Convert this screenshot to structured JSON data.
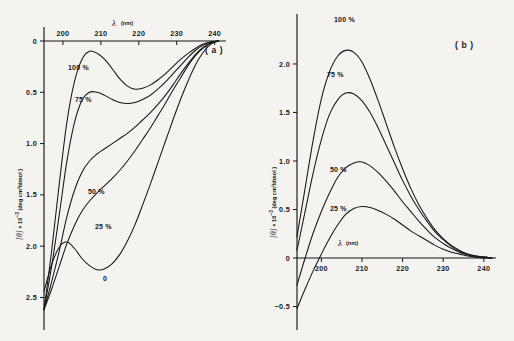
{
  "figure": {
    "background_color": "#f4f3f0",
    "ink_color": "#161616",
    "panel_a_tag": "( a )",
    "panel_b_tag": "( b )"
  },
  "panel_a": {
    "name": "panel-a",
    "x_axis": {
      "title_symbol": "λ",
      "title_unit": "(nm)",
      "ticks": [
        200,
        210,
        220,
        230,
        240
      ],
      "tick_labels": [
        "200",
        "210",
        "220",
        "230",
        "240"
      ],
      "range": [
        195,
        243
      ],
      "position": "top"
    },
    "y_axis": {
      "title_symbol": "[θ]",
      "title_mid": " × 10",
      "title_exp": "−3",
      "title_unit": " (deg cm²/dmol )",
      "ticks": [
        0,
        0.5,
        1.0,
        1.5,
        2.0,
        2.5
      ],
      "tick_labels": [
        "0",
        "0.5",
        "1.0",
        "1.5",
        "2.0",
        "2.5"
      ],
      "range": [
        0,
        2.7
      ],
      "direction": "inverted-downward"
    },
    "curve_labels": [
      "100 %",
      "75 %",
      "50 %",
      "25 %",
      "0"
    ]
  },
  "panel_b": {
    "name": "panel-b",
    "x_axis": {
      "title_symbol": "λ",
      "title_unit": "(nm)",
      "ticks": [
        200,
        210,
        220,
        230,
        240
      ],
      "tick_labels": [
        "200",
        "210",
        "220",
        "230",
        "240"
      ],
      "range": [
        194,
        243
      ],
      "position": "bottom"
    },
    "y_axis": {
      "title_symbol": "[θ]",
      "title_mid": " × 10",
      "title_exp": "−3",
      "title_unit": " (deg cm²/dmol )",
      "ticks": [
        -0.5,
        0,
        0.5,
        1.0,
        1.5,
        2.0
      ],
      "tick_labels": [
        "−0.5",
        "0",
        "0.5",
        "1.0",
        "1.5",
        "2.0"
      ],
      "range": [
        -0.65,
        2.35
      ]
    },
    "curve_labels": [
      "100 %",
      "75 %",
      "50 %",
      "25 %"
    ]
  },
  "chart_data": [
    {
      "type": "line",
      "title": "Panel (a) CD spectra",
      "xlabel": "λ (nm)",
      "ylabel": "[θ] × 10⁻³ (deg cm²/dmol)",
      "xlim": [
        195,
        243
      ],
      "ylim": [
        0,
        2.7
      ],
      "y_inverted": true,
      "grid": false,
      "legend": "inline-annotations",
      "x": [
        195,
        197,
        199,
        201,
        203,
        205,
        207,
        209,
        211,
        213,
        215,
        217,
        219,
        221,
        223,
        225,
        227,
        229,
        231,
        233,
        235,
        237,
        239,
        241
      ],
      "series": [
        {
          "name": "100 %",
          "values": [
            2.62,
            2.05,
            1.4,
            0.8,
            0.4,
            0.18,
            0.1,
            0.12,
            0.18,
            0.27,
            0.37,
            0.44,
            0.47,
            0.46,
            0.43,
            0.38,
            0.32,
            0.25,
            0.18,
            0.12,
            0.07,
            0.03,
            0.01,
            0.0
          ]
        },
        {
          "name": "75 %",
          "values": [
            2.62,
            2.2,
            1.7,
            1.18,
            0.8,
            0.58,
            0.5,
            0.5,
            0.53,
            0.57,
            0.6,
            0.61,
            0.6,
            0.57,
            0.53,
            0.47,
            0.4,
            0.32,
            0.24,
            0.16,
            0.09,
            0.04,
            0.01,
            0.0
          ]
        },
        {
          "name": "50 %",
          "values": [
            2.62,
            2.35,
            2.05,
            1.72,
            1.46,
            1.28,
            1.17,
            1.1,
            1.05,
            1.0,
            0.95,
            0.9,
            0.84,
            0.77,
            0.7,
            0.62,
            0.53,
            0.43,
            0.32,
            0.22,
            0.13,
            0.06,
            0.02,
            0.0
          ]
        },
        {
          "name": "25 %",
          "values": [
            2.62,
            2.42,
            2.2,
            1.98,
            1.8,
            1.66,
            1.56,
            1.48,
            1.41,
            1.34,
            1.26,
            1.17,
            1.07,
            0.96,
            0.85,
            0.73,
            0.61,
            0.48,
            0.36,
            0.24,
            0.14,
            0.07,
            0.02,
            0.0
          ]
        },
        {
          "name": "0",
          "values": [
            2.44,
            2.18,
            2.01,
            1.96,
            2.02,
            2.12,
            2.19,
            2.23,
            2.22,
            2.17,
            2.08,
            1.95,
            1.79,
            1.6,
            1.4,
            1.19,
            0.98,
            0.77,
            0.57,
            0.39,
            0.23,
            0.11,
            0.03,
            0.0
          ]
        }
      ]
    },
    {
      "type": "line",
      "title": "Panel (b) CD spectra",
      "xlabel": "λ (nm)",
      "ylabel": "[θ] × 10⁻³ (deg cm²/dmol)",
      "xlim": [
        194,
        243
      ],
      "ylim": [
        -0.65,
        2.35
      ],
      "y_inverted": false,
      "grid": false,
      "legend": "inline-annotations",
      "x": [
        194,
        196,
        198,
        200,
        202,
        204,
        206,
        208,
        210,
        212,
        214,
        216,
        218,
        220,
        222,
        224,
        226,
        228,
        230,
        232,
        234,
        236,
        238,
        240,
        242
      ],
      "series": [
        {
          "name": "100 %",
          "values": [
            0.22,
            0.72,
            1.22,
            1.64,
            1.92,
            2.08,
            2.14,
            2.12,
            2.02,
            1.84,
            1.62,
            1.38,
            1.14,
            0.92,
            0.72,
            0.55,
            0.41,
            0.29,
            0.2,
            0.13,
            0.08,
            0.04,
            0.02,
            0.01,
            0.0
          ]
        },
        {
          "name": "75 %",
          "values": [
            0.08,
            0.48,
            0.88,
            1.22,
            1.48,
            1.63,
            1.7,
            1.69,
            1.62,
            1.5,
            1.34,
            1.16,
            0.98,
            0.8,
            0.64,
            0.5,
            0.38,
            0.27,
            0.19,
            0.12,
            0.07,
            0.04,
            0.02,
            0.01,
            0.0
          ]
        },
        {
          "name": "50 %",
          "values": [
            -0.28,
            0.0,
            0.26,
            0.48,
            0.67,
            0.83,
            0.93,
            0.98,
            0.99,
            0.95,
            0.88,
            0.79,
            0.69,
            0.58,
            0.48,
            0.38,
            0.29,
            0.21,
            0.15,
            0.1,
            0.06,
            0.03,
            0.01,
            0.01,
            0.0
          ]
        },
        {
          "name": "25 %",
          "values": [
            -0.52,
            -0.32,
            -0.13,
            0.04,
            0.2,
            0.34,
            0.45,
            0.51,
            0.53,
            0.52,
            0.49,
            0.45,
            0.4,
            0.34,
            0.28,
            0.23,
            0.18,
            0.13,
            0.09,
            0.06,
            0.04,
            0.02,
            0.01,
            0.0,
            0.0
          ]
        }
      ]
    }
  ]
}
